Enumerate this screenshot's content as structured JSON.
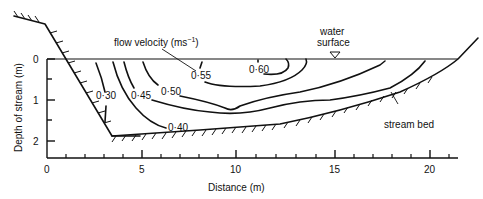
{
  "figure": {
    "type": "stream cross-section velocity isovel diagram",
    "xlabel": "Distance (m)",
    "ylabel": "Depth of stream (m)",
    "x_ticks": [
      "0",
      "5",
      "10",
      "15",
      "20"
    ],
    "y_ticks": [
      "0",
      "1",
      "2"
    ],
    "annotations": {
      "flow_velocity": "flow velocity (ms",
      "flow_velocity_sup": "−1",
      "flow_velocity_close": ")",
      "water_surface_1": "water",
      "water_surface_2": "surface",
      "stream_bed": "stream bed"
    },
    "contour_labels": [
      "0·30",
      "0·45",
      "0·50",
      "0·55",
      "0·60",
      "0·40"
    ],
    "contour_values_ms": [
      0.3,
      0.4,
      0.45,
      0.5,
      0.55,
      0.6
    ]
  }
}
